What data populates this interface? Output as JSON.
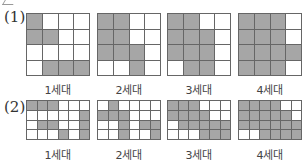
{
  "colors": {
    "filled": "#a6a6a6",
    "empty": "#ffffff",
    "gridline": "#666666"
  },
  "parts": [
    {
      "label": "(1)",
      "rows": 4,
      "cols": 4,
      "generations": [
        {
          "label": "1세대",
          "cells": [
            [
              1,
              0,
              0,
              0
            ],
            [
              1,
              1,
              0,
              0
            ],
            [
              0,
              0,
              0,
              0
            ],
            [
              0,
              1,
              1,
              1
            ]
          ]
        },
        {
          "label": "2세대",
          "cells": [
            [
              1,
              1,
              0,
              0
            ],
            [
              1,
              1,
              0,
              0
            ],
            [
              1,
              1,
              1,
              0
            ],
            [
              0,
              0,
              1,
              0
            ]
          ]
        },
        {
          "label": "3세대",
          "cells": [
            [
              1,
              1,
              0,
              0
            ],
            [
              1,
              1,
              1,
              0
            ],
            [
              1,
              1,
              1,
              0
            ],
            [
              0,
              1,
              1,
              0
            ]
          ]
        },
        {
          "label": "4세대",
          "cells": [
            [
              1,
              1,
              1,
              0
            ],
            [
              1,
              1,
              1,
              0
            ],
            [
              1,
              1,
              1,
              1
            ],
            [
              1,
              1,
              1,
              0
            ]
          ]
        }
      ]
    },
    {
      "label": "(2)",
      "rows": 4,
      "cols": 6,
      "generations": [
        {
          "label": "1세대",
          "cells": [
            [
              1,
              1,
              1,
              0,
              0,
              0
            ],
            [
              0,
              0,
              0,
              0,
              0,
              1
            ],
            [
              0,
              1,
              1,
              0,
              0,
              1
            ],
            [
              0,
              0,
              0,
              1,
              0,
              1
            ]
          ]
        },
        {
          "label": "2세대",
          "cells": [
            [
              0,
              1,
              0,
              0,
              0,
              0
            ],
            [
              1,
              1,
              1,
              0,
              0,
              0
            ],
            [
              0,
              0,
              1,
              0,
              1,
              1
            ],
            [
              0,
              0,
              1,
              0,
              0,
              1
            ]
          ]
        },
        {
          "label": "3세대",
          "cells": [
            [
              1,
              1,
              1,
              0,
              0,
              0
            ],
            [
              1,
              1,
              1,
              1,
              0,
              0
            ],
            [
              0,
              1,
              1,
              1,
              1,
              1
            ],
            [
              0,
              0,
              0,
              1,
              1,
              1
            ]
          ]
        },
        {
          "label": "4세대",
          "cells": [
            [
              1,
              1,
              1,
              1,
              0,
              0
            ],
            [
              1,
              1,
              1,
              1,
              1,
              0
            ],
            [
              1,
              1,
              1,
              1,
              1,
              1
            ],
            [
              0,
              0,
              1,
              1,
              1,
              1
            ]
          ]
        }
      ]
    }
  ]
}
